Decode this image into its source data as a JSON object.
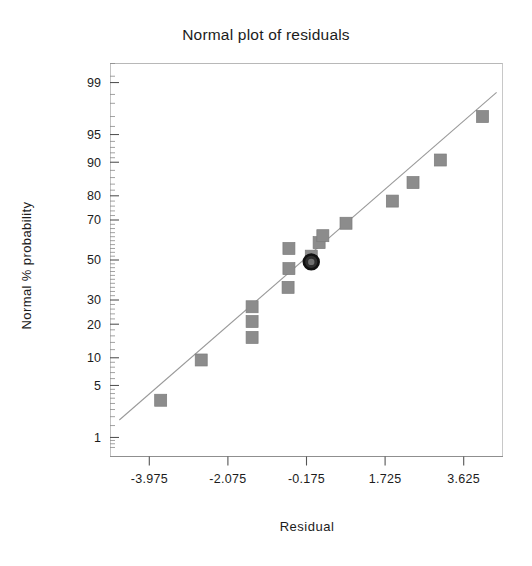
{
  "chart_data": {
    "type": "scatter",
    "title": "Normal plot of residuals",
    "xlabel": "Residual",
    "ylabel": "Normal % probability",
    "grid": false,
    "legend": null,
    "xlim": [
      -4.925,
      4.575
    ],
    "xticks": [
      "-3.975",
      "-2.075",
      "-0.175",
      "1.725",
      "3.625"
    ],
    "xtick_values": [
      -3.975,
      -2.075,
      -0.175,
      1.725,
      3.625
    ],
    "yscale": "normal-probability",
    "ylim": [
      0.5,
      99.5
    ],
    "yticks": [
      "99",
      "95",
      "90",
      "80",
      "70",
      "50",
      "30",
      "20",
      "10",
      "5",
      "1"
    ],
    "ytick_values": [
      99,
      95,
      90,
      80,
      70,
      50,
      30,
      20,
      10,
      5,
      1
    ],
    "point_color": "#8c8c8c",
    "highlight_color": "#111111",
    "line_color": "#9a9a9a",
    "series": [
      {
        "name": "residuals",
        "marker": "square",
        "points": [
          {
            "x": -3.7,
            "y": 3.3
          },
          {
            "x": -2.72,
            "y": 9.5
          },
          {
            "x": -1.49,
            "y": 27.0
          },
          {
            "x": -1.49,
            "y": 21.0
          },
          {
            "x": -1.49,
            "y": 15.5
          },
          {
            "x": -0.62,
            "y": 36.0
          },
          {
            "x": -0.6,
            "y": 45.5
          },
          {
            "x": -0.6,
            "y": 56.0
          },
          {
            "x": -0.06,
            "y": 52.0
          },
          {
            "x": 0.13,
            "y": 59.0
          },
          {
            "x": 0.22,
            "y": 62.5
          },
          {
            "x": 0.78,
            "y": 68.5
          },
          {
            "x": 1.9,
            "y": 78.0
          },
          {
            "x": 2.4,
            "y": 84.5
          },
          {
            "x": 3.06,
            "y": 90.5
          },
          {
            "x": 4.08,
            "y": 97.0
          }
        ]
      },
      {
        "name": "highlighted-point",
        "marker": "circle",
        "points": [
          {
            "x": -0.06,
            "y": 49.0
          }
        ]
      }
    ],
    "reference_line": {
      "name": "normal-reference-line",
      "x1": -4.7,
      "y1": 1.8,
      "x2": 4.42,
      "y2": 98.6
    }
  }
}
